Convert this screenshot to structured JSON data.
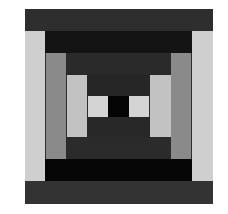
{
  "figure": {
    "colors": {
      "outer_top": "#2e2e2e",
      "outer_sides": "#cfcfcf",
      "outer_bottom": "#333333",
      "ring2_top": "#141414",
      "ring2_sides": "#8a8a8a",
      "ring2_bottom": "#060606",
      "ring3_top": "#2a2a2a",
      "ring3_sides": "#c2c2c2",
      "ring3_bottom": "#2b2b2b",
      "inner_top": "#262626",
      "inner_bottom": "#282828",
      "center_light": "#d4d4d4",
      "center_dark": "#050505"
    }
  }
}
